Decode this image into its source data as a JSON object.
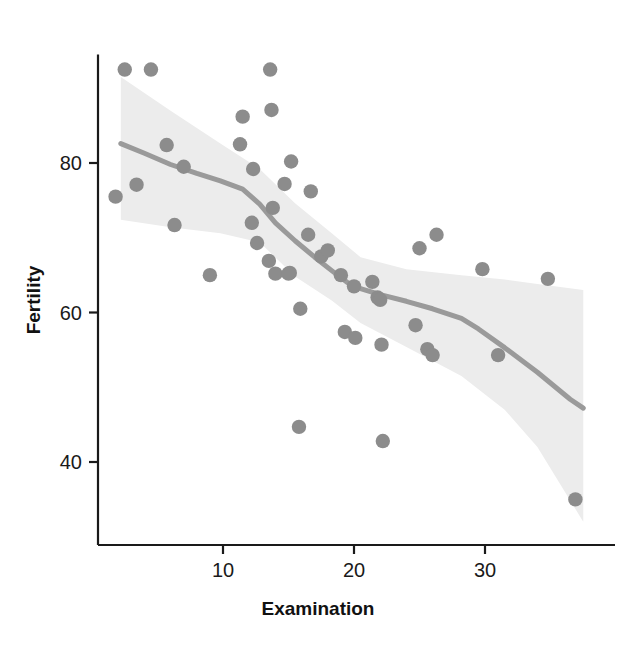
{
  "chart_data": {
    "type": "scatter",
    "title": "",
    "xlabel": "Examination",
    "ylabel": "Fertility",
    "xlim": [
      1.0,
      38.5
    ],
    "ylim": [
      31.0,
      94.5
    ],
    "xticks": [
      10,
      20,
      30
    ],
    "xtick_labels": [
      "10",
      "20",
      "30"
    ],
    "yticks": [
      40,
      60,
      80
    ],
    "ytick_labels": [
      "40",
      "60",
      "80"
    ],
    "grid": false,
    "legend": "none",
    "point_color": "#8c8c8c",
    "line_color": "#9a9a9a",
    "band_color": "#ececec",
    "axis_color": "#1a1a1a",
    "series": [
      {
        "name": "Swiss provinces",
        "type": "scatter",
        "x": [
          2.5,
          4.5,
          1.8,
          3.4,
          5.7,
          7.0,
          6.3,
          9.0,
          12.3,
          12.2,
          11.5,
          11.3,
          12.6,
          13.6,
          13.7,
          13.8,
          13.5,
          14.0,
          15.2,
          14.7,
          15.1,
          15.0,
          16.7,
          15.9,
          15.8,
          16.5,
          17.5,
          18.0,
          19.0,
          19.3,
          20.0,
          20.1,
          21.4,
          21.8,
          22.0,
          22.1,
          22.2,
          24.7,
          25.6,
          26.0,
          25.0,
          26.3,
          29.8,
          31.0,
          34.8,
          36.9
        ],
        "y": [
          92.5,
          92.5,
          75.5,
          77.1,
          82.4,
          79.5,
          71.7,
          65.0,
          79.2,
          72.0,
          86.2,
          82.5,
          69.3,
          92.5,
          87.1,
          74.0,
          66.9,
          65.2,
          80.2,
          77.2,
          65.3,
          65.2,
          76.2,
          60.5,
          44.7,
          70.4,
          67.5,
          68.3,
          65.0,
          57.4,
          63.5,
          56.6,
          64.1,
          62.0,
          61.7,
          55.7,
          42.8,
          58.3,
          55.1,
          54.3,
          68.6,
          70.4,
          65.8,
          54.3,
          64.5,
          35.0
        ]
      },
      {
        "name": "LOESS smooth",
        "type": "line",
        "x": [
          2.2,
          4.0,
          6.0,
          8.0,
          9.8,
          11.5,
          12.8,
          14.0,
          15.5,
          17.0,
          18.3,
          19.5,
          20.5,
          22.0,
          24.0,
          26.0,
          28.2,
          29.5,
          31.5,
          34.0,
          36.5,
          37.5
        ],
        "y": [
          82.6,
          81.3,
          79.8,
          78.6,
          77.6,
          76.5,
          74.5,
          72.0,
          69.6,
          67.4,
          65.6,
          64.0,
          63.2,
          62.4,
          61.5,
          60.5,
          59.2,
          57.8,
          55.3,
          52.0,
          48.4,
          47.2
        ]
      },
      {
        "name": "95% confidence band upper",
        "type": "line",
        "x": [
          2.2,
          6.0,
          9.8,
          12.8,
          15.5,
          18.3,
          20.5,
          24.0,
          28.2,
          31.5,
          34.0,
          37.5
        ],
        "y": [
          91.5,
          87.0,
          82.6,
          79.2,
          74.6,
          70.6,
          67.4,
          65.8,
          65.0,
          64.4,
          63.8,
          63.0
        ]
      },
      {
        "name": "95% confidence band lower",
        "type": "line",
        "x": [
          2.2,
          6.0,
          9.8,
          12.8,
          15.5,
          18.3,
          20.5,
          24.0,
          28.2,
          31.5,
          34.0,
          37.5
        ],
        "y": [
          72.4,
          71.4,
          70.6,
          69.4,
          64.8,
          61.6,
          58.6,
          55.4,
          51.5,
          47.0,
          42.0,
          32.0
        ]
      }
    ]
  },
  "axes": {
    "x_title": "Examination",
    "y_title": "Fertility"
  }
}
